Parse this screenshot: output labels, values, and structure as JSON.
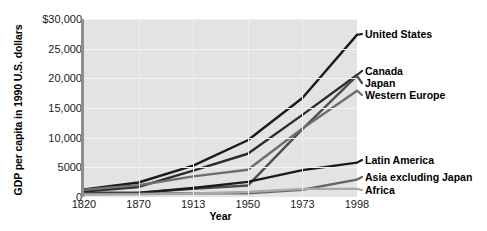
{
  "chart_data": {
    "type": "line",
    "title": "",
    "xlabel": "Year",
    "ylabel": "GDP per capita in 1990 U.S. dollars",
    "categories": [
      "1820",
      "1870",
      "1913",
      "1950",
      "1973",
      "1998"
    ],
    "ylim": [
      0,
      30000
    ],
    "yticks": [
      "0",
      "5000",
      "10,000",
      "15,000",
      "20,000",
      "25,000",
      "$30,000"
    ],
    "ytick_values": [
      0,
      5000,
      10000,
      15000,
      20000,
      25000,
      30000
    ],
    "grid": true,
    "legend_position": "right-inline-labels",
    "series": [
      {
        "name": "United States",
        "values": [
          1257,
          2445,
          5301,
          9561,
          16689,
          27331
        ],
        "color": "#1a1a1a"
      },
      {
        "name": "Canada",
        "values": [
          904,
          1695,
          4447,
          7291,
          13838,
          20559
        ],
        "color": "#2b2b2b"
      },
      {
        "name": "Japan",
        "values": [
          669,
          737,
          1387,
          1926,
          11439,
          20413
        ],
        "color": "#4d4d4d"
      },
      {
        "name": "Western Europe",
        "values": [
          1232,
          1974,
          3473,
          4594,
          11534,
          17921
        ],
        "color": "#6e6e6e"
      },
      {
        "name": "Latin America",
        "values": [
          665,
          698,
          1511,
          2554,
          4531,
          5795
        ],
        "color": "#1a1a1a"
      },
      {
        "name": "Asia excluding Japan",
        "values": [
          575,
          543,
          640,
          635,
          1231,
          2936
        ],
        "color": "#666666"
      },
      {
        "name": "Africa",
        "values": [
          418,
          444,
          585,
          852,
          1365,
          1368
        ],
        "color": "#a8a8a8"
      }
    ]
  },
  "axes": {
    "x_title": "Year",
    "y_title": "GDP per capita in 1990 U.S. dollars"
  },
  "labels": {
    "united_states": "United States",
    "canada": "Canada",
    "japan": "Japan",
    "western_europe": "Western Europe",
    "latin_america": "Latin America",
    "asia_excluding_japan": "Asia excluding Japan",
    "africa": "Africa"
  },
  "colors": {
    "plot_background": "#e3e3e3",
    "gridline": "#f4f4f4",
    "axis_spine": "#8d8d8d",
    "text": "#000000"
  }
}
